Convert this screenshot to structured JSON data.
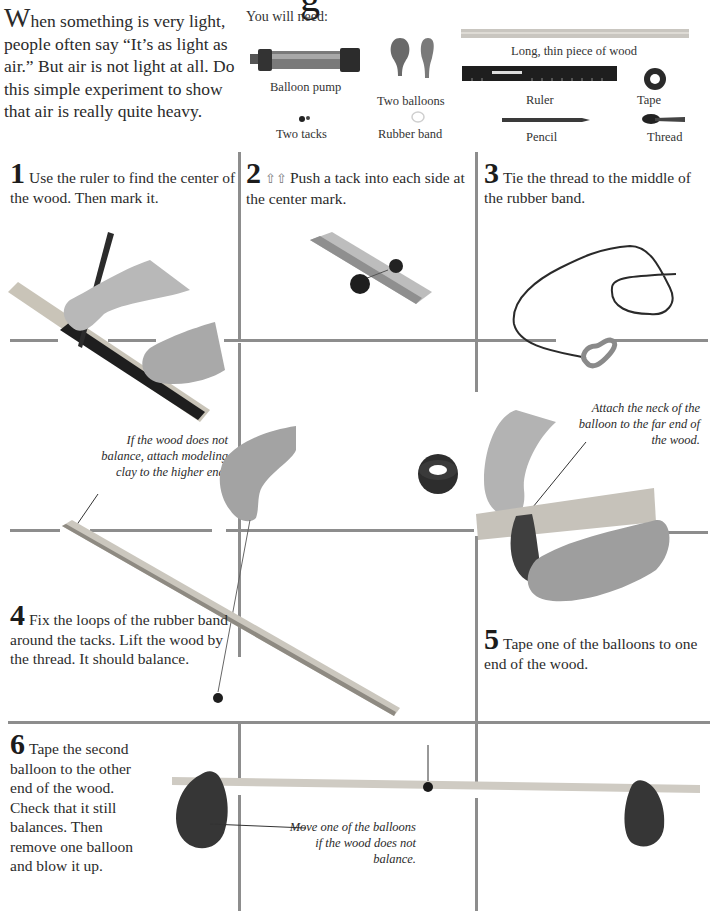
{
  "title_fragment": "g",
  "intro": {
    "dropcap": "W",
    "text": "hen something is very light, people often say “It’s as light as air.” But air is not light at all. Do this simple experiment to show that air is really quite heavy."
  },
  "materials": {
    "heading": "You will need:",
    "items": [
      {
        "label": "Balloon pump",
        "icon": "balloon-pump-icon"
      },
      {
        "label": "Two balloons",
        "icon": "balloons-icon"
      },
      {
        "label": "Long, thin piece of wood",
        "icon": "wood-stick-icon"
      },
      {
        "label": "Ruler",
        "icon": "ruler-icon"
      },
      {
        "label": "Tape",
        "icon": "tape-icon"
      },
      {
        "label": "Two tacks",
        "icon": "tacks-icon"
      },
      {
        "label": "Rubber band",
        "icon": "rubber-band-icon"
      },
      {
        "label": "Pencil",
        "icon": "pencil-icon"
      },
      {
        "label": "Thread",
        "icon": "thread-icon"
      }
    ]
  },
  "steps": [
    {
      "number": "1",
      "text": "Use the ruler to find the center of the wood. Then mark it."
    },
    {
      "number": "2",
      "adult_icon": "adult-help-icon",
      "text": "Push a tack into each side at the center mark."
    },
    {
      "number": "3",
      "text": "Tie the thread to the middle of the rubber band."
    },
    {
      "number": "4",
      "text": "Fix the loops of the rubber band around the tacks. Lift the wood by the thread. It should balance."
    },
    {
      "number": "5",
      "text": "Tape one of the balloons to one end of the wood."
    },
    {
      "number": "6",
      "text": "Tape the second balloon to the other end of the wood. Check that it still balances. Then remove one balloon and blow it up."
    }
  ],
  "notes": {
    "clay": "If the wood does not balance, attach modeling clay to the higher end.",
    "neck": "Attach the neck of the balloon to the far end of the wood.",
    "move": "Move one of the balloons if the wood does not balance."
  },
  "colors": {
    "grid_line": "#8d8d8d",
    "text": "#2b2b2b",
    "balloon": "#3a3a3a",
    "wood": "#d4d0c8"
  }
}
